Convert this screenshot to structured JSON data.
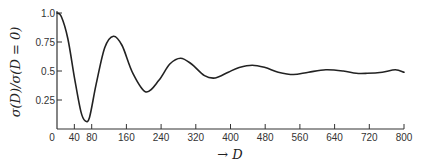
{
  "chart_data": {
    "type": "line",
    "title": "",
    "xlabel": "→ D",
    "ylabel": "σ(D)/σ(D = 0)",
    "xlim": [
      0,
      800
    ],
    "ylim": [
      0,
      1.0
    ],
    "grid": false,
    "legend": null,
    "x_ticks": [
      0,
      40,
      80,
      160,
      240,
      320,
      400,
      480,
      560,
      640,
      720,
      800
    ],
    "x_tick_labels": [
      "0",
      "40",
      "80",
      "160",
      "240",
      "320",
      "400",
      "480",
      "560",
      "640",
      "720",
      "800"
    ],
    "y_ticks": [
      0.25,
      0.5,
      0.75,
      1.0
    ],
    "y_tick_labels": [
      "0.25",
      "0.5",
      "0.75",
      "1.0"
    ],
    "series": [
      {
        "name": "σ(D)/σ(D=0)",
        "x": [
          0,
          10,
          25,
          40,
          55,
          65,
          75,
          90,
          110,
          130,
          150,
          175,
          205,
          235,
          260,
          285,
          310,
          340,
          365,
          395,
          420,
          450,
          480,
          510,
          545,
          580,
          620,
          660,
          690,
          715,
          750,
          780,
          800
        ],
        "y": [
          1.0,
          0.97,
          0.78,
          0.45,
          0.15,
          0.07,
          0.1,
          0.38,
          0.7,
          0.8,
          0.72,
          0.48,
          0.32,
          0.42,
          0.56,
          0.61,
          0.56,
          0.46,
          0.44,
          0.49,
          0.53,
          0.55,
          0.53,
          0.49,
          0.47,
          0.49,
          0.51,
          0.5,
          0.48,
          0.48,
          0.49,
          0.51,
          0.49
        ]
      }
    ]
  }
}
